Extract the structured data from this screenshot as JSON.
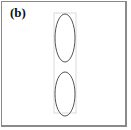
{
  "panel": {
    "label": "(b)"
  },
  "diagram": {
    "bounding_box": {
      "x": 54,
      "y": 13,
      "width": 22,
      "height": 100,
      "stroke": "#d0d0d0"
    },
    "ellipses": [
      {
        "name": "top-ellipse",
        "cx": 65,
        "cy": 38,
        "rx": 10,
        "ry": 24,
        "stroke": "#555555"
      },
      {
        "name": "bottom-ellipse",
        "cx": 65,
        "cy": 94,
        "rx": 10,
        "ry": 22,
        "stroke": "#555555"
      }
    ]
  }
}
